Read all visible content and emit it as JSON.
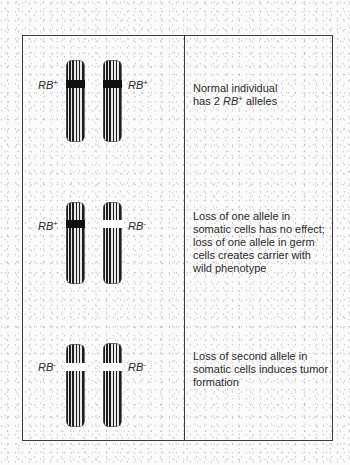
{
  "figure": {
    "type": "genetics-diagram",
    "colors": {
      "border": "#3a3a3a",
      "chromosome_stripe": "#1e1e1e",
      "band_present": "#111111",
      "band_absent": "#ffffff",
      "text": "#2a2a2a"
    }
  },
  "rows": [
    {
      "left_label": {
        "gene": "RB",
        "sign": "+"
      },
      "right_label": {
        "gene": "RB",
        "sign": "+"
      },
      "left_chromosome": {
        "band": "present"
      },
      "right_chromosome": {
        "band": "present"
      },
      "description": {
        "line1": "Normal individual",
        "line2_prefix": "has 2 ",
        "line2_gene": "RB",
        "line2_sign": "+",
        "line2_suffix": " alleles"
      }
    },
    {
      "left_label": {
        "gene": "RB",
        "sign": "+"
      },
      "right_label": {
        "gene": "RB",
        "sign": "-"
      },
      "left_chromosome": {
        "band": "present"
      },
      "right_chromosome": {
        "band": "absent"
      },
      "description": {
        "text": "Loss of one allele in somatic cells has no effect; loss of one allele in germ cells creates carrier with wild phenotype"
      }
    },
    {
      "left_label": {
        "gene": "RB",
        "sign": "-"
      },
      "right_label": {
        "gene": "RB",
        "sign": "-"
      },
      "left_chromosome": {
        "band": "absent"
      },
      "right_chromosome": {
        "band": "absent"
      },
      "description": {
        "text": "Loss of second allele in somatic cells induces tumor formation"
      }
    }
  ]
}
